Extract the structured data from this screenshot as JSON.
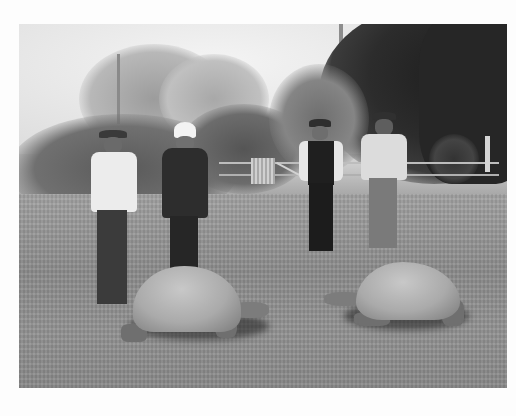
{
  "photo": {
    "description": "Black-and-white historical photograph: four men standing on a grassy lawn with two giant tortoises in the foreground, trees and a wooden fence with gate in the background",
    "palette": {
      "sky": "#e6e6e6",
      "dark_trees": "#2a2a2a",
      "mid_trees": "#6a6a6a",
      "lawn": "#939393",
      "shell": "#b0b0b0",
      "border": "#fdfdfd"
    },
    "subjects": {
      "men": [
        {
          "id": "man-1",
          "attire": "white shirt, dark trousers, dark hat"
        },
        {
          "id": "man-2",
          "attire": "dark suit, white pith helmet"
        },
        {
          "id": "man-3",
          "attire": "dark waistcoat, white shirt, dark hat"
        },
        {
          "id": "man-4",
          "attire": "light shirt and waistcoat, light trousers, dark hat"
        }
      ],
      "tortoises": [
        {
          "id": "tortoise-left",
          "facing": "right"
        },
        {
          "id": "tortoise-right",
          "facing": "left"
        }
      ]
    }
  }
}
